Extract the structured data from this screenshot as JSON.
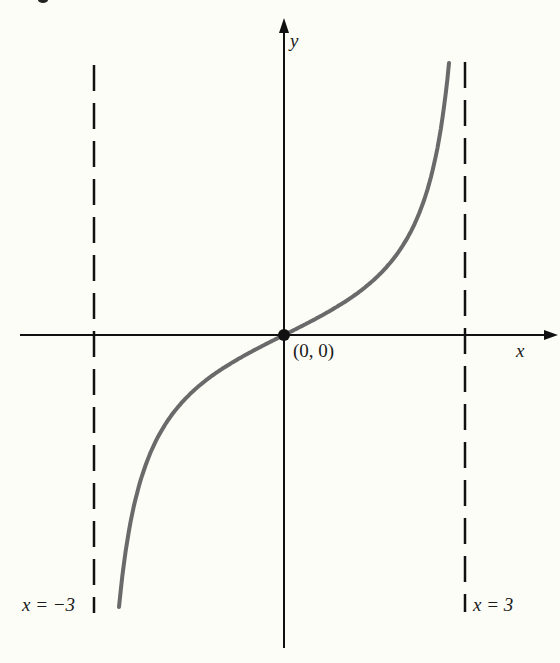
{
  "figure": {
    "axis_labels": {
      "x": "x",
      "y": "y"
    },
    "origin_label": "(0, 0)",
    "asymptotes": [
      {
        "label": "x = −3",
        "x_value": -3,
        "style": "dashed"
      },
      {
        "label": "x = 3",
        "x_value": 3,
        "style": "dashed"
      }
    ],
    "curve": {
      "description": "Increasing odd function through origin with vertical asymptotes at x = −3 and x = 3",
      "color": "#6a6a6a",
      "passes_through": [
        [
          0,
          0
        ]
      ]
    },
    "colors": {
      "background": "#fdfdf7",
      "ink": "#111111",
      "curve": "#6a6a6a"
    }
  }
}
